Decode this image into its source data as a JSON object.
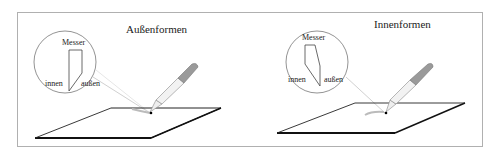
{
  "panels": [
    {
      "title": "Außenformen",
      "knife_label": "Messer",
      "inner_label": "innen",
      "outer_label": "außen"
    },
    {
      "title": "Innenformen",
      "knife_label": "Messer",
      "inner_label": "innen",
      "outer_label": "außen"
    }
  ],
  "colors": {
    "frame": "#b0b0b0",
    "line": "#222222",
    "grip": "#9a9a9a",
    "circle": "#777777"
  }
}
